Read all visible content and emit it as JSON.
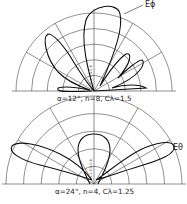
{
  "figure": {
    "plots": [
      {
        "id": "top",
        "curve_label": "Eϕ",
        "caption": "α=12°, n=8, Cλ=1.5",
        "parameters": {
          "alpha_deg": 12,
          "n": 8,
          "C_lambda": 1.5
        }
      },
      {
        "id": "bottom",
        "curve_label": "Eθ",
        "caption": "α=24°, n=4, Cλ=1.25",
        "parameters": {
          "alpha_deg": 24,
          "n": 4,
          "C_lambda": 1.25
        }
      }
    ],
    "grid": {
      "type": "polar-half",
      "rings": 5,
      "radial_lines_deg": [
        0,
        30,
        60,
        90,
        120,
        150,
        180
      ]
    },
    "colors": {
      "ink": "#222222",
      "grid": "#444444",
      "background": "#ffffff"
    }
  }
}
